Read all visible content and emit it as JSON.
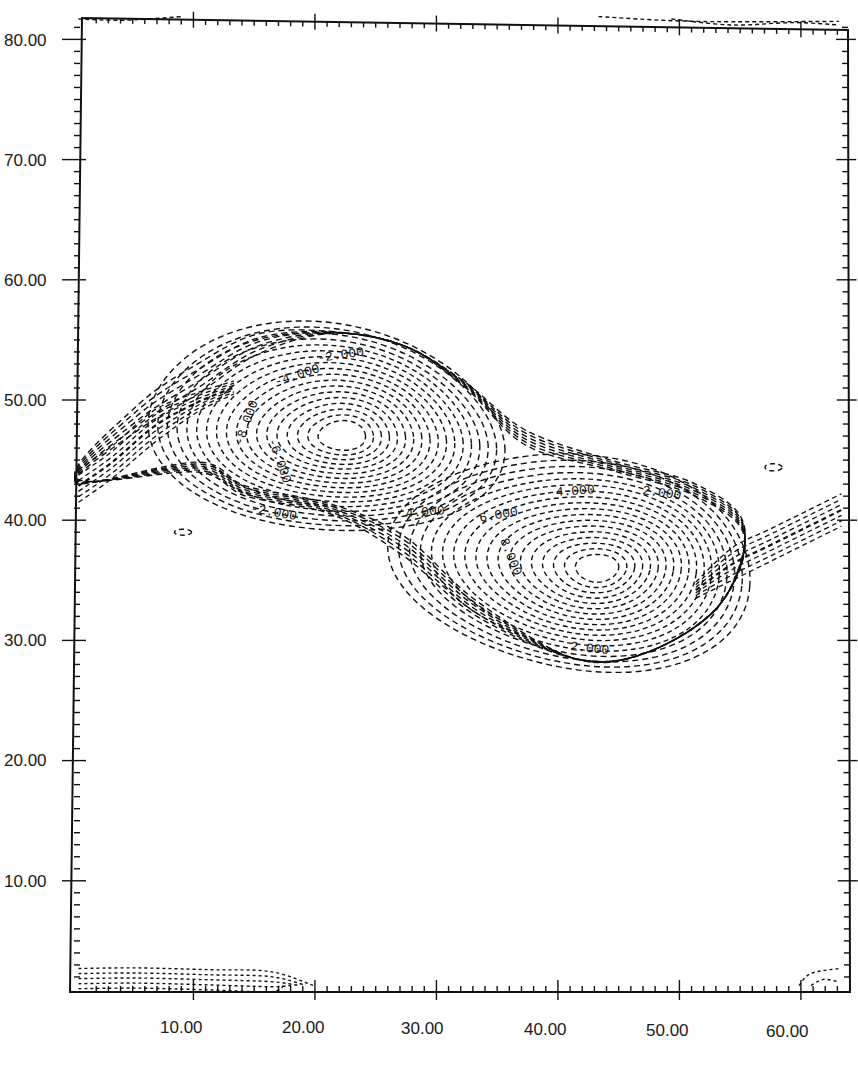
{
  "chart_data": {
    "type": "contour",
    "title": "",
    "xlabel": "",
    "ylabel": "",
    "xlim": [
      1,
      64
    ],
    "ylim": [
      1,
      82
    ],
    "grid": false,
    "legend": null,
    "line_style": "dashed",
    "x_ticks": [
      "10.00",
      "20.00",
      "30.00",
      "40.00",
      "50.00",
      "60.00"
    ],
    "y_ticks": [
      "10.00",
      "20.00",
      "30.00",
      "40.00",
      "50.00",
      "60.00",
      "70.00",
      "80.00"
    ],
    "x_tick_values": [
      10,
      20,
      30,
      40,
      50,
      60
    ],
    "y_tick_values": [
      10,
      20,
      30,
      40,
      50,
      60,
      70,
      80
    ],
    "contour_labels": [
      {
        "text": "-2.000",
        "x": 24.5,
        "y": 53.5
      },
      {
        "text": "-4.000",
        "x": 20.0,
        "y": 52.0
      },
      {
        "text": "-8.000",
        "x": 15.5,
        "y": 47.5
      },
      {
        "text": "-6.000",
        "x": 17.0,
        "y": 45.0
      },
      {
        "text": "-2.000",
        "x": 16.5,
        "y": 41.0
      },
      {
        "text": "4.000",
        "x": 32.5,
        "y": 40.5
      },
      {
        "text": "6.000",
        "x": 38.5,
        "y": 41.0
      },
      {
        "text": "4.000",
        "x": 42.5,
        "y": 42.0
      },
      {
        "text": "2.000",
        "x": 50.0,
        "y": 42.0
      },
      {
        "text": "8.000",
        "x": 40.0,
        "y": 35.0
      },
      {
        "text": "2.000",
        "x": 44.0,
        "y": 30.0
      }
    ],
    "features": [
      {
        "name": "negative vortex",
        "center_x": 23,
        "center_y": 47,
        "extent_x": [
          11,
          38
        ],
        "extent_y": [
          40,
          55.5
        ],
        "min_level": -8.0
      },
      {
        "name": "positive vortex",
        "center_x": 44,
        "center_y": 36,
        "extent_x": [
          26,
          56
        ],
        "extent_y": [
          28,
          45
        ],
        "max_level": 8.0
      },
      {
        "name": "shear layer band",
        "description": "thin sloping band from left edge (x≈1,y≈42) rising to x≈12,y≈50 and from x≈56,y≈36 rising to right edge (x≈64,y≈40)"
      },
      {
        "name": "bottom boundary contours",
        "extent_x": [
          1,
          21
        ],
        "extent_y": [
          1,
          3
        ]
      },
      {
        "name": "top boundary contours",
        "extent_x": [
          1,
          10
        ],
        "extent_y": [
          81,
          82
        ]
      }
    ],
    "levels": [
      -8.0,
      -6.0,
      -4.0,
      -2.0,
      2.0,
      4.0,
      6.0,
      8.0
    ]
  }
}
